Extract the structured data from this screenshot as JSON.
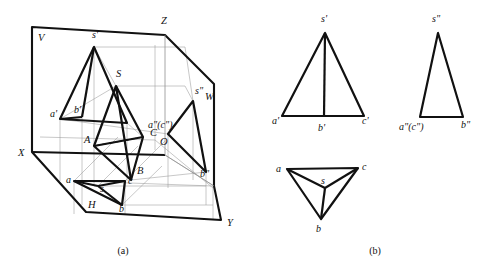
{
  "figure": {
    "panels": [
      {
        "id": "a",
        "caption": "(a)",
        "caption_x": 123,
        "caption_y": 254,
        "description": "Pictorial view: pyramid inside the three projection planes V, H, W"
      },
      {
        "id": "b",
        "caption": "(b)",
        "caption_x": 375,
        "caption_y": 254,
        "description": "Orthographic three-view drawing: front, side and top views"
      }
    ],
    "colors": {
      "ink": "#111111",
      "thin": "#8a8a8a",
      "thick": "#000000",
      "paper": "#ffffff"
    }
  },
  "panel_a": {
    "plane_labels": [
      {
        "name": "V",
        "text": "V",
        "x": 38,
        "y": 41
      },
      {
        "name": "W",
        "text": "W",
        "x": 205,
        "y": 100
      },
      {
        "name": "H",
        "text": "H",
        "x": 88,
        "y": 208
      }
    ],
    "axis_labels": [
      {
        "name": "Z",
        "text": "Z",
        "x": 161,
        "y": 24
      },
      {
        "name": "X",
        "text": "X",
        "x": 18,
        "y": 156
      },
      {
        "name": "Y",
        "text": "Y",
        "x": 227,
        "y": 226
      },
      {
        "name": "O",
        "text": "O",
        "x": 160,
        "y": 145
      }
    ],
    "space_point_labels": [
      {
        "name": "S",
        "text": "S",
        "x": 116,
        "y": 77
      },
      {
        "name": "A",
        "text": "A",
        "x": 84,
        "y": 143
      },
      {
        "name": "B",
        "text": "B",
        "x": 137,
        "y": 174
      },
      {
        "name": "C",
        "text": "C",
        "x": 150,
        "y": 136
      }
    ],
    "front_projection_labels": [
      {
        "name": "s-prime",
        "text": "s'",
        "x": 92,
        "y": 38
      },
      {
        "name": "a-prime",
        "text": "a'",
        "x": 50,
        "y": 117
      },
      {
        "name": "b-prime",
        "text": "b'",
        "x": 74,
        "y": 113
      }
    ],
    "side_projection_labels": [
      {
        "name": "s-double-prime",
        "text": "s\"",
        "x": 195,
        "y": 94
      },
      {
        "name": "ac-double-prime",
        "text": "a\"(c\")",
        "x": 148,
        "y": 128
      },
      {
        "name": "b-double-prime",
        "text": "b\"",
        "x": 200,
        "y": 177
      }
    ],
    "top_projection_labels": [
      {
        "name": "a-small",
        "text": "a",
        "x": 66,
        "y": 183
      },
      {
        "name": "b-small",
        "text": "b",
        "x": 119,
        "y": 212
      },
      {
        "name": "c-small",
        "text": "c",
        "x": 128,
        "y": 184
      },
      {
        "name": "s-small",
        "text": "s",
        "x": 100,
        "y": 192
      }
    ]
  },
  "panel_b": {
    "front_view": {
      "name": "front-view",
      "labels": [
        {
          "name": "s-prime",
          "text": "s'",
          "x": 321,
          "y": 22
        },
        {
          "name": "a-prime",
          "text": "a'",
          "x": 272,
          "y": 124
        },
        {
          "name": "b-prime",
          "text": "b'",
          "x": 318,
          "y": 131
        },
        {
          "name": "c-prime",
          "text": "c'",
          "x": 362,
          "y": 124
        }
      ]
    },
    "side_view": {
      "name": "side-view",
      "labels": [
        {
          "name": "s-double-prime",
          "text": "s\"",
          "x": 432,
          "y": 22
        },
        {
          "name": "ac-double-prime",
          "text": "a\"(c\")",
          "x": 399,
          "y": 130
        },
        {
          "name": "b-double-prime",
          "text": "b\"",
          "x": 461,
          "y": 128
        }
      ]
    },
    "top_view": {
      "name": "top-view",
      "labels": [
        {
          "name": "a-small",
          "text": "a",
          "x": 276,
          "y": 172
        },
        {
          "name": "c-small",
          "text": "c",
          "x": 362,
          "y": 170
        },
        {
          "name": "s-small",
          "text": "s",
          "x": 321,
          "y": 184
        },
        {
          "name": "b-small",
          "text": "b",
          "x": 316,
          "y": 232
        }
      ]
    }
  },
  "geometry": {
    "panel_a": {
      "planes_outline": "M32,27 L165,35 L165,155 L221,220 L86,212 L32,152 Z",
      "v_plane": "M32,27 L165,35 L165,155 L32,152 Z",
      "h_plane": "M32,152 L165,155 L221,220 L86,212 Z",
      "w_plane": "M165,35 L214,84 L214,186 L165,155 Z",
      "axes": {
        "OZ": "M155,140 L155,45",
        "OX": "M155,140 L40,137",
        "OY_right": "M155,140 L213,188",
        "OY_down": "M155,140 L155,150"
      },
      "solid_S": [
        116,
        86
      ],
      "solid_A": [
        94,
        146
      ],
      "solid_B": [
        131,
        180
      ],
      "solid_C": [
        143,
        137
      ],
      "front_s": [
        94,
        47
      ],
      "front_a": [
        60,
        119
      ],
      "front_b": [
        82,
        117
      ],
      "front_c": [
        127,
        123
      ],
      "side_s": [
        193,
        101
      ],
      "side_ac": [
        168,
        134
      ],
      "side_b": [
        206,
        172
      ],
      "top_s": [
        98,
        186
      ],
      "top_a": [
        74,
        181
      ],
      "top_b": [
        122,
        205
      ],
      "top_c": [
        125,
        181
      ]
    },
    "panel_b": {
      "front": {
        "s": [
          325,
          33
        ],
        "a": [
          282,
          116
        ],
        "b": [
          324,
          117
        ],
        "c": [
          364,
          116
        ]
      },
      "side": {
        "s": [
          438,
          33
        ],
        "a": [
          420,
          117
        ],
        "b": [
          463,
          117
        ]
      },
      "top": {
        "a": [
          287,
          169
        ],
        "b": [
          321,
          219
        ],
        "c": [
          358,
          168
        ],
        "s": [
          325,
          188
        ]
      }
    }
  }
}
